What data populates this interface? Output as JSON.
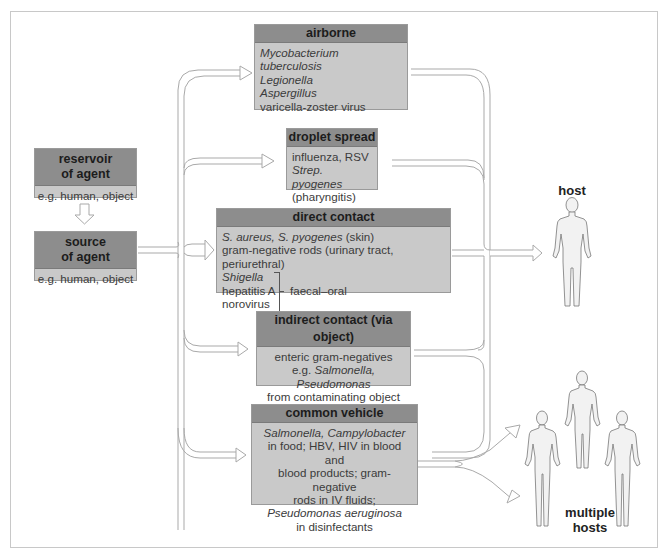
{
  "figure": {
    "reservoir": {
      "title_line1": "reservoir",
      "title_line2": "of agent",
      "example": "e.g. human, object"
    },
    "source": {
      "title_line1": "source",
      "title_line2": "of agent",
      "example": "e.g. human, object"
    },
    "routes": [
      {
        "title": "airborne",
        "lines": [
          {
            "text": "Mycobacterium tuberculosis",
            "italic": true
          },
          {
            "text": "Legionella",
            "italic": true
          },
          {
            "text": "Aspergillus",
            "italic": true
          },
          {
            "text": "varicella-zoster virus",
            "italic": false
          }
        ]
      },
      {
        "title": "droplet spread",
        "lines": [
          {
            "text": "influenza, RSV",
            "italic": false
          },
          {
            "text": "Strep. pyogenes",
            "italic": true
          },
          {
            "text": "(pharyngitis)",
            "italic": false
          }
        ]
      },
      {
        "title": "direct contact",
        "line1_italic": "S. aureus, S. pyogenes",
        "line1_rest": " (skin)",
        "line2": "gram-negative rods (urinary tract, periurethral)",
        "line3": "Shigella",
        "line4": "hepatitis A",
        "line5": "norovirus",
        "bracket_label": "faecal–oral"
      },
      {
        "title": "indirect contact (via object)",
        "line1": "enteric gram-negatives",
        "line2_prefix": "e.g. ",
        "line2_italic": "Salmonella, Pseudomonas",
        "line3": "from contaminating object",
        "line4": "e.g. endoscope"
      },
      {
        "title": "common vehicle",
        "line1": "Salmonella, Campylobacter",
        "line2": "in food; HBV, HIV in blood and",
        "line3": "blood products; gram-negative",
        "line4": "rods in IV fluids;",
        "line5": "Pseudomonas aeruginosa",
        "line6": "in disinfectants"
      }
    ],
    "host_label": "host",
    "multiple_hosts_label_line1": "multiple",
    "multiple_hosts_label_line2": "hosts"
  },
  "colors": {
    "header": "#8d8d8d",
    "body": "#c9c9c9",
    "text": "#3b3b3b",
    "wire": "#a8a8a8"
  }
}
